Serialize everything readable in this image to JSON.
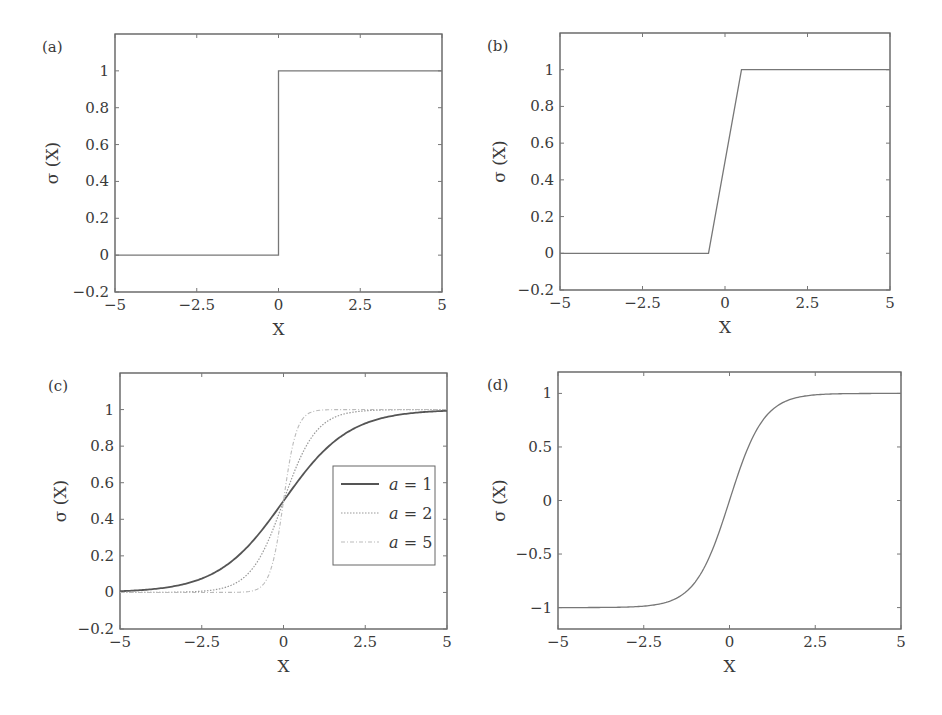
{
  "figure": {
    "panels": [
      {
        "id": "a",
        "label": "(a)",
        "xlabel": "X",
        "ylabel": "σ (X)"
      },
      {
        "id": "b",
        "label": "(b)",
        "xlabel": "X",
        "ylabel": "σ (X)"
      },
      {
        "id": "c",
        "label": "(c)",
        "xlabel": "X",
        "ylabel": "σ (X)",
        "legend": [
          {
            "label": "a = 1",
            "style": "solid"
          },
          {
            "label": "a = 2",
            "style": "dotted"
          },
          {
            "label": "a = 5",
            "style": "dash-dot"
          }
        ]
      },
      {
        "id": "d",
        "label": "(d)",
        "xlabel": "X",
        "ylabel": "σ (X)"
      }
    ]
  },
  "chart_data": [
    {
      "type": "line",
      "title": "(a) Step (threshold) function",
      "xlabel": "X",
      "ylabel": "σ (X)",
      "xlim": [
        -5,
        5
      ],
      "ylim": [
        -0.2,
        1.2
      ],
      "xticks": [
        -5,
        -2.5,
        0,
        2.5,
        5
      ],
      "xtick_labels": [
        "−5",
        "−2.5",
        "0",
        "2.5",
        "5"
      ],
      "yticks": [
        -0.2,
        0,
        0.2,
        0.4,
        0.6,
        0.8,
        1
      ],
      "ytick_labels": [
        "−0.2",
        "0",
        "0.2",
        "0.4",
        "0.6",
        "0.8",
        "1"
      ],
      "grid": false,
      "series": [
        {
          "name": "step",
          "x": [
            -5,
            0,
            0,
            5
          ],
          "y": [
            0,
            0,
            1,
            1
          ]
        }
      ]
    },
    {
      "type": "line",
      "title": "(b) Piecewise linear function",
      "xlabel": "X",
      "ylabel": "σ (X)",
      "xlim": [
        -5,
        5
      ],
      "ylim": [
        -0.2,
        1.2
      ],
      "xticks": [
        -5,
        -2.5,
        0,
        2.5,
        5
      ],
      "xtick_labels": [
        "−5",
        "−2.5",
        "0",
        "2.5",
        "5"
      ],
      "yticks": [
        -0.2,
        0,
        0.2,
        0.4,
        0.6,
        0.8,
        1
      ],
      "ytick_labels": [
        "−0.2",
        "0",
        "0.2",
        "0.4",
        "0.6",
        "0.8",
        "1"
      ],
      "grid": false,
      "series": [
        {
          "name": "piecewise-linear",
          "x": [
            -5,
            -0.5,
            0.5,
            5
          ],
          "y": [
            0,
            0,
            1,
            1
          ]
        }
      ]
    },
    {
      "type": "line",
      "title": "(c) Logistic sigmoid with slope parameter a",
      "xlabel": "X",
      "ylabel": "σ (X)",
      "xlim": [
        -5,
        5
      ],
      "ylim": [
        -0.2,
        1.2
      ],
      "xticks": [
        -5,
        -2.5,
        0,
        2.5,
        5
      ],
      "xtick_labels": [
        "−5",
        "−2.5",
        "0",
        "2.5",
        "5"
      ],
      "yticks": [
        -0.2,
        0,
        0.2,
        0.4,
        0.6,
        0.8,
        1
      ],
      "ytick_labels": [
        "−0.2",
        "0",
        "0.2",
        "0.4",
        "0.6",
        "0.8",
        "1"
      ],
      "grid": false,
      "legend_position": "center right",
      "series": [
        {
          "name": "a = 1",
          "a": 1,
          "x": [
            -5,
            -4,
            -3,
            -2,
            -1,
            0,
            1,
            2,
            3,
            4,
            5
          ],
          "y": [
            0.007,
            0.018,
            0.047,
            0.119,
            0.269,
            0.5,
            0.731,
            0.881,
            0.953,
            0.982,
            0.993
          ]
        },
        {
          "name": "a = 2",
          "a": 2,
          "x": [
            -5,
            -4,
            -3,
            -2,
            -1,
            0,
            1,
            2,
            3,
            4,
            5
          ],
          "y": [
            0.0,
            0.0,
            0.002,
            0.018,
            0.119,
            0.5,
            0.881,
            0.982,
            0.998,
            1.0,
            1.0
          ]
        },
        {
          "name": "a = 5",
          "a": 5,
          "x": [
            -5,
            -2,
            -1,
            -0.5,
            0,
            0.5,
            1,
            2,
            5
          ],
          "y": [
            0.0,
            0.0,
            0.007,
            0.076,
            0.5,
            0.924,
            0.993,
            1.0,
            1.0
          ]
        }
      ]
    },
    {
      "type": "line",
      "title": "(d) Hyperbolic tangent",
      "xlabel": "X",
      "ylabel": "σ (X)",
      "xlim": [
        -5,
        5
      ],
      "ylim": [
        -1.2,
        1.2
      ],
      "xticks": [
        -5,
        -2.5,
        0,
        2.5,
        5
      ],
      "xtick_labels": [
        "−5",
        "−2.5",
        "0",
        "2.5",
        "5"
      ],
      "yticks": [
        -1,
        -0.5,
        0,
        0.5,
        1
      ],
      "ytick_labels": [
        "−1",
        "−0.5",
        "0",
        "0.5",
        "1"
      ],
      "grid": false,
      "series": [
        {
          "name": "tanh",
          "x": [
            -5,
            -3,
            -2,
            -1,
            -0.5,
            0,
            0.5,
            1,
            2,
            3,
            5
          ],
          "y": [
            -1.0,
            -0.995,
            -0.964,
            -0.762,
            -0.462,
            0,
            0.462,
            0.762,
            0.964,
            0.995,
            1.0
          ]
        }
      ]
    }
  ]
}
